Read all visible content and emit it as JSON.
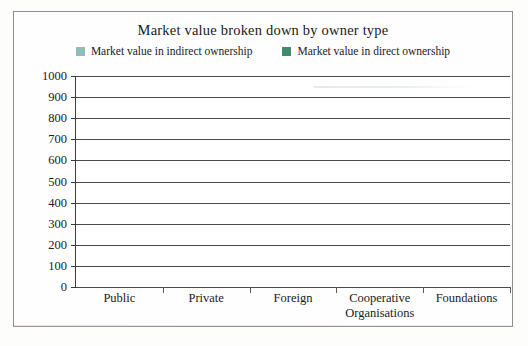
{
  "chart_data": {
    "type": "bar",
    "subtype": "stacked-column",
    "title": "Market value broken down by owner type",
    "xlabel": "",
    "ylabel": "",
    "ylim": [
      0,
      1000
    ],
    "ytick_step": 100,
    "yticks": [
      "1000",
      "900",
      "800",
      "700",
      "600",
      "500",
      "400",
      "300",
      "200",
      "100",
      "0"
    ],
    "grid": true,
    "legend_position": "top",
    "categories": [
      "Public",
      "Private",
      "Foreign",
      "Cooperative Organisations",
      "Foundations"
    ],
    "category_lines": [
      [
        "Public"
      ],
      [
        "Private"
      ],
      [
        "Foreign"
      ],
      [
        "Cooperative",
        "Organisations"
      ],
      [
        "Foundations"
      ]
    ],
    "series": [
      {
        "name": "Market value in direct ownership",
        "color": "#3f8b6d",
        "values": [
          425,
          430,
          475,
          200,
          65
        ]
      },
      {
        "name": "Market value in indirect ownership",
        "color": "#92bdb6",
        "values": [
          485,
          390,
          290,
          0,
          0
        ]
      }
    ],
    "totals": [
      910,
      820,
      765,
      200,
      65
    ]
  },
  "legend": {
    "entries": [
      {
        "label": "Market value in indirect ownership",
        "color": "#92bdb6"
      },
      {
        "label": "Market value in direct ownership",
        "color": "#3f8b6d"
      }
    ]
  }
}
